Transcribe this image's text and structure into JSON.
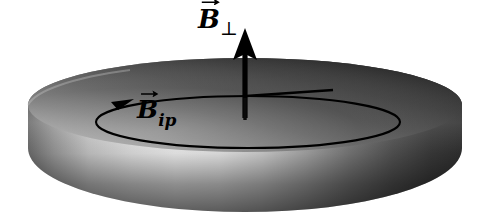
{
  "figure": {
    "background_color": "#ffffff",
    "width": 484,
    "height": 224,
    "stroke_color": "#000000"
  },
  "disk": {
    "name": "cylindrical disk",
    "top_face_color_dark": "#3a3a3a",
    "top_face_color_light": "#8e8e8e",
    "side_wall_bright": "#f2f2f2",
    "side_wall_dark": "#2b2b2b",
    "center_x": 245,
    "top_rim_y": 58,
    "bottom_y": 212,
    "left_x": 28,
    "right_x": 462
  },
  "labels": {
    "perpendicular": {
      "base": "B",
      "subscript": "⊥",
      "icon": "vector-arrow-overbar",
      "full_text": "B⊥"
    },
    "in_plane": {
      "base": "B",
      "subscript": "ip",
      "icon": "vector-arrow-overbar",
      "full_text": "Bip"
    }
  },
  "arrows": {
    "perpendicular": {
      "name": "vertical-field-arrow",
      "direction": "up",
      "tip_y": 30,
      "base_y": 118,
      "x": 245
    },
    "in_plane": {
      "name": "circular-field-arrow",
      "direction": "clockwise",
      "arrowhead_x": 126,
      "arrowhead_y": 101
    },
    "radius_line": {
      "name": "radius-reference-line",
      "from_x": 245,
      "from_y": 95,
      "to_x": 332,
      "to_y": 90
    }
  }
}
